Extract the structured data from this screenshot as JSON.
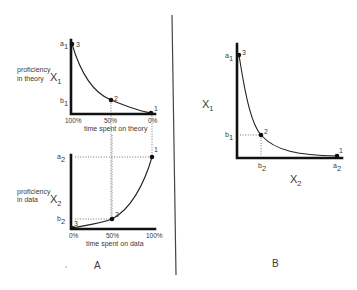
{
  "panel_a": {
    "label": "A",
    "top_graph": {
      "y_label_line1": "proficiency",
      "y_label_line2": "in theory",
      "y_symbol": "X",
      "y_symbol_sub": "1",
      "tick_a": "a",
      "tick_a_sub": "1",
      "tick_b": "b",
      "tick_b_sub": "1",
      "x_ticks": [
        "100%",
        "50%",
        "0%"
      ],
      "x_label": "time spent on theory",
      "points": [
        "3",
        "2",
        "1"
      ]
    },
    "bottom_graph": {
      "y_label_line1": "proficiency",
      "y_label_line2": "in data",
      "y_symbol": "X",
      "y_symbol_sub": "2",
      "tick_a": "a",
      "tick_a_sub": "2",
      "tick_b": "b",
      "tick_b_sub": "2",
      "x_ticks": [
        "0%",
        "50%",
        "100%"
      ],
      "x_label": "time spent on data",
      "points": [
        "3",
        "2",
        "1"
      ]
    }
  },
  "panel_b": {
    "label": "B",
    "y_symbol": "X",
    "y_symbol_sub": "1",
    "x_symbol": "X",
    "x_symbol_sub": "2",
    "tick_a1": "a",
    "tick_a1_sub": "1",
    "tick_b1": "b",
    "tick_b1_sub": "1",
    "tick_b2": "b",
    "tick_b2_sub": "2",
    "tick_a2": "a",
    "tick_a2_sub": "2",
    "points": [
      "3",
      "2",
      "1"
    ]
  },
  "colors": {
    "ink": "#111111",
    "text": "#3a3a3a",
    "background": "#ffffff"
  }
}
